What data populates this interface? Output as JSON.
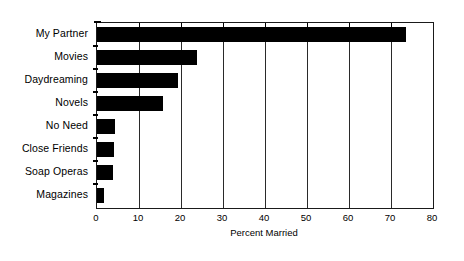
{
  "chart_data": {
    "type": "bar",
    "orientation": "horizontal",
    "title": "",
    "xlabel": "Percent Married",
    "ylabel": "",
    "xlim": [
      0,
      80
    ],
    "xticks": [
      0,
      10,
      20,
      30,
      40,
      50,
      60,
      70,
      80
    ],
    "grid": true,
    "legend": false,
    "bar_color": "#000000",
    "background_color": "#ffffff",
    "categories": [
      "My Partner",
      "Movies",
      "Daydreaming",
      "Novels",
      "No Need",
      "Close Friends",
      "Soap Operas",
      "Magazines"
    ],
    "values": [
      73.5,
      23.8,
      19.3,
      15.7,
      4.3,
      4.0,
      3.8,
      1.7
    ],
    "series": [
      {
        "name": "Percent Married",
        "values": [
          73.5,
          23.8,
          19.3,
          15.7,
          4.3,
          4.0,
          3.8,
          1.7
        ]
      }
    ],
    "tick_labels": {
      "t0": "0",
      "t1": "10",
      "t2": "20",
      "t3": "30",
      "t4": "40",
      "t5": "50",
      "t6": "60",
      "t7": "70",
      "t8": "80"
    },
    "category_labels": {
      "c0": "My Partner",
      "c1": "Movies",
      "c2": "Daydreaming",
      "c3": "Novels",
      "c4": "No Need",
      "c5": "Close Friends",
      "c6": "Soap Operas",
      "c7": "Magazines"
    }
  }
}
